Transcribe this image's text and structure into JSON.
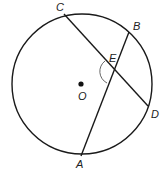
{
  "figure": {
    "type": "circle-chords",
    "circle": {
      "cx": 82,
      "cy": 84,
      "r": 70
    },
    "center_point": {
      "label": "O",
      "x": 81,
      "y": 84
    },
    "points": [
      {
        "label": "C",
        "x": 64,
        "y": 14
      },
      {
        "label": "B",
        "x": 129,
        "y": 32
      },
      {
        "label": "E",
        "x": 115,
        "y": 70
      },
      {
        "label": "D",
        "x": 148,
        "y": 106
      },
      {
        "label": "A",
        "x": 81,
        "y": 156
      }
    ],
    "chords": [
      {
        "name": "CD",
        "from": "C",
        "to": "D"
      },
      {
        "name": "AB",
        "from": "A",
        "to": "B"
      }
    ],
    "angle_mark": {
      "at": "E",
      "between": [
        "C",
        "A"
      ]
    },
    "labels": {
      "C": "C",
      "B": "B",
      "E": "E",
      "O": "O",
      "D": "D",
      "A": "A"
    },
    "colors": {
      "stroke": "#1a1a1a",
      "label": "#222222"
    }
  }
}
